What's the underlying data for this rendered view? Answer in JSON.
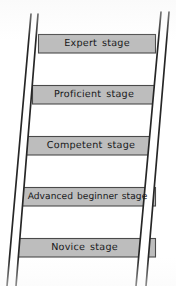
{
  "figure": {
    "type": "ladder-diagram",
    "background_color": "#ffffff",
    "rung_fill_color": "#bdbdbd",
    "rung_border_color": "#4a4a4a",
    "rail_color": "#262626",
    "text_color": "#17181a",
    "rail_count": 2,
    "rung_count": 5
  },
  "rungs": [
    {
      "index": 1,
      "label": "Expert stage",
      "position": "top",
      "box": {
        "left": 38,
        "top": 34,
        "width": 118,
        "height": 19
      }
    },
    {
      "index": 2,
      "label": "Proficient stage",
      "position": "second",
      "box": {
        "left": 32,
        "top": 85,
        "width": 124,
        "height": 19
      }
    },
    {
      "index": 3,
      "label": "Competent stage",
      "position": "middle",
      "box": {
        "left": 26,
        "top": 136,
        "width": 130,
        "height": 19
      }
    },
    {
      "index": 4,
      "label": "Advanced beginner stage",
      "position": "fourth",
      "box": {
        "left": 19,
        "top": 187,
        "width": 137,
        "height": 19
      }
    },
    {
      "index": 5,
      "label": "Novice stage",
      "position": "bottom",
      "box": {
        "left": 13,
        "top": 238,
        "width": 143,
        "height": 19
      }
    }
  ],
  "rails": {
    "left": {
      "name": "left-rail",
      "outer_top_x": 31,
      "outer_bottom_x": 7,
      "inner_top_x": 38,
      "inner_bottom_x": 16,
      "top_y": 14,
      "bottom_y": 286
    },
    "right": {
      "name": "right-rail",
      "inner_top_x": 161,
      "inner_bottom_x": 136,
      "outer_top_x": 169,
      "outer_bottom_x": 146,
      "top_y": 12,
      "bottom_y": 286
    }
  }
}
